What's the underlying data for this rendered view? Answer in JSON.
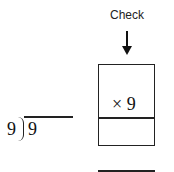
{
  "check": {
    "label": "Check",
    "arrow_icon": "down-arrow-icon"
  },
  "division": {
    "divisor": "9",
    "dividend": "9",
    "quotient": ""
  },
  "check_box": {
    "top_cell": "",
    "multiplier": "× 9",
    "product_cell": "",
    "answer": ""
  }
}
